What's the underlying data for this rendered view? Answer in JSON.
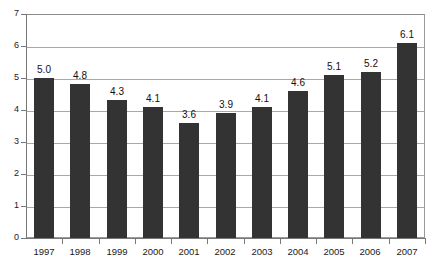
{
  "chart_data": {
    "type": "bar",
    "title": "",
    "subtitle": "",
    "xlabel": "",
    "ylabel": "",
    "categories": [
      "1997",
      "1998",
      "1999",
      "2000",
      "2001",
      "2002",
      "2003",
      "2004",
      "2005",
      "2006",
      "2007"
    ],
    "values": [
      5.0,
      4.8,
      4.3,
      4.1,
      3.6,
      3.9,
      4.1,
      4.6,
      5.1,
      5.2,
      6.1
    ],
    "data_labels": [
      "5.0",
      "4.8",
      "4.3",
      "4.1",
      "3.6",
      "3.9",
      "4.1",
      "4.6",
      "5.1",
      "5.2",
      "6.1"
    ],
    "ylim": [
      0,
      7
    ],
    "y_ticks": [
      0,
      1,
      2,
      3,
      4,
      5,
      6,
      7
    ],
    "y_tick_labels": [
      "0",
      "1",
      "2",
      "3",
      "4",
      "5",
      "6",
      "7"
    ],
    "grid": true,
    "grid_orientation": "horizontal",
    "legend": false,
    "legend_position": "none",
    "series": [
      {
        "name": "",
        "values": [
          5.0,
          4.8,
          4.3,
          4.1,
          3.6,
          3.9,
          4.1,
          4.6,
          5.1,
          5.2,
          6.1
        ]
      }
    ],
    "colors": {
      "bar": "#333333",
      "gridline": "#a8a8a8",
      "axis": "#777777",
      "frame": "#9a9a9a",
      "background": "#ffffff",
      "text": "#1a1a1a"
    }
  }
}
